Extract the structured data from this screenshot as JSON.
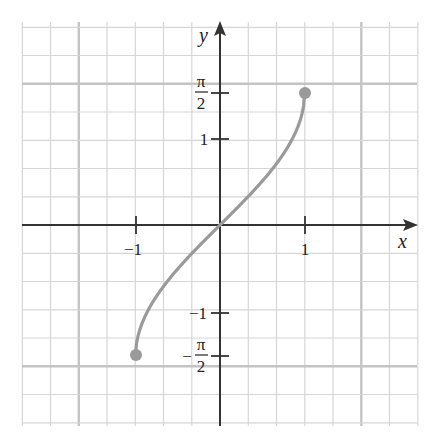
{
  "chart_data": {
    "type": "line",
    "title": "",
    "function": "y = arcsin(x)",
    "xlabel": "x",
    "ylabel": "y",
    "xlim": [
      -2.33,
      2.33
    ],
    "ylim": [
      -2.33,
      2.33
    ],
    "grid": true,
    "grid_step": 0.3333,
    "x_ticks": [
      {
        "value": -1,
        "label": "−1"
      },
      {
        "value": 1,
        "label": "1"
      }
    ],
    "y_ticks": [
      {
        "value": 1.5708,
        "label_num": "π",
        "label_den": "2",
        "sign": ""
      },
      {
        "value": 1,
        "label": "1"
      },
      {
        "value": -1,
        "label": "−1"
      },
      {
        "value": -1.5708,
        "label_num": "π",
        "label_den": "2",
        "sign": "−"
      }
    ],
    "series": [
      {
        "name": "arcsin(x)",
        "x": [
          -1,
          -0.95,
          -0.9,
          -0.8,
          -0.6,
          -0.4,
          -0.2,
          0,
          0.2,
          0.4,
          0.6,
          0.8,
          0.9,
          0.95,
          1
        ],
        "y": [
          -1.5708,
          -1.2532,
          -1.1198,
          -0.9273,
          -0.6435,
          -0.4115,
          -0.2014,
          0,
          0.2014,
          0.4115,
          0.6435,
          0.9273,
          1.1198,
          1.2532,
          1.5708
        ]
      }
    ],
    "endpoints": [
      {
        "x": -1,
        "y": -1.5708,
        "closed": true
      },
      {
        "x": 1,
        "y": 1.5708,
        "closed": true
      }
    ],
    "colors": {
      "curve": "#9a9a9a",
      "axis": "#333333",
      "grid": "#d6d6d6",
      "grid_major": "#c4c4c4"
    }
  },
  "labels": {
    "x_axis": "x",
    "y_axis": "y",
    "x_tick_neg1": "−1",
    "x_tick_1": "1",
    "y_tick_1": "1",
    "y_tick_neg1": "−1",
    "pi": "π",
    "two": "2",
    "minus": "−"
  }
}
